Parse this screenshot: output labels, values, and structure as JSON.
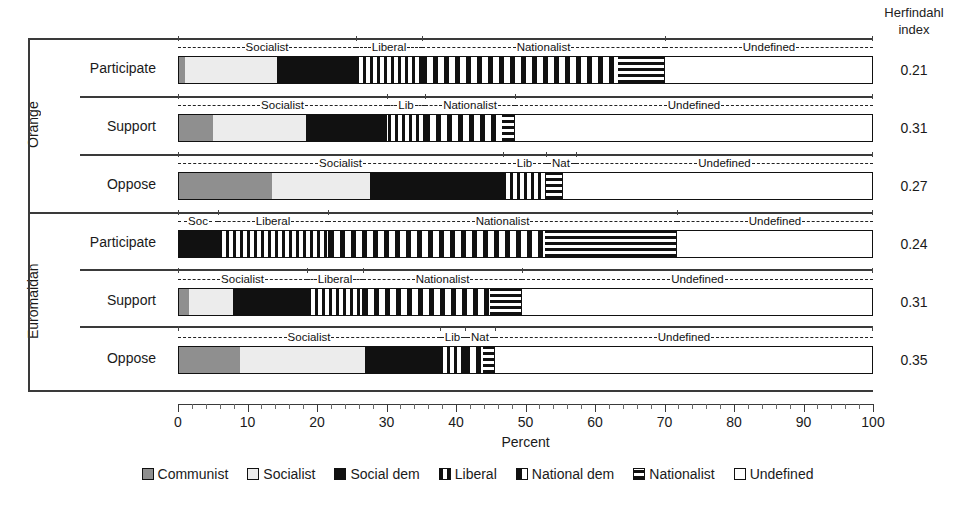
{
  "herfindahl_header": {
    "line1": "Herfindahl",
    "line2": "index"
  },
  "axis": {
    "title": "Percent",
    "ticks": [
      "0",
      "10",
      "20",
      "30",
      "40",
      "50",
      "60",
      "70",
      "80",
      "90",
      "100"
    ]
  },
  "groups": [
    {
      "name": "Orange"
    },
    {
      "name": "Euromaidan"
    }
  ],
  "rows": [
    {
      "group": "Orange",
      "category": "Participate",
      "herfindahl": "0.21"
    },
    {
      "group": "Orange",
      "category": "Support",
      "herfindahl": "0.31"
    },
    {
      "group": "Orange",
      "category": "Oppose",
      "herfindahl": "0.27"
    },
    {
      "group": "Euromaidan",
      "category": "Participate",
      "herfindahl": "0.24"
    },
    {
      "group": "Euromaidan",
      "category": "Support",
      "herfindahl": "0.31"
    },
    {
      "group": "Euromaidan",
      "category": "Oppose",
      "herfindahl": "0.35"
    }
  ],
  "legend": [
    {
      "label": "Communist",
      "pattern": "communist"
    },
    {
      "label": "Socialist",
      "pattern": "socialist"
    },
    {
      "label": "Social dem",
      "pattern": "socialdem"
    },
    {
      "label": "Liberal",
      "pattern": "liberal"
    },
    {
      "label": "National dem",
      "pattern": "nationaldem"
    },
    {
      "label": "Nationalist",
      "pattern": "nationalist"
    },
    {
      "label": "Undefined",
      "pattern": "undefined"
    }
  ],
  "annotations": [
    [
      {
        "text": "Socialist",
        "from": 0,
        "to": 25.6
      },
      {
        "text": "Liberal",
        "from": 25.6,
        "to": 35.1
      },
      {
        "text": "Nationalist",
        "from": 35.1,
        "to": 70.1
      },
      {
        "text": "Undefined",
        "from": 70.1,
        "to": 100
      }
    ],
    [
      {
        "text": "Socialist",
        "from": 0,
        "to": 30.1
      },
      {
        "text": "Lib",
        "from": 30.1,
        "to": 35.5
      },
      {
        "text": "Nationalist",
        "from": 35.5,
        "to": 48.5
      },
      {
        "text": "Undefined",
        "from": 48.5,
        "to": 100
      }
    ],
    [
      {
        "text": "Socialist",
        "from": 0,
        "to": 46.8
      },
      {
        "text": "Lib",
        "from": 46.8,
        "to": 52.9
      },
      {
        "text": "Nat",
        "from": 52.9,
        "to": 55.4
      },
      {
        "text": "Undefined",
        "from": 55.4,
        "to": 100
      }
    ],
    [
      {
        "text": "Soc",
        "from": 0,
        "to": 5.8
      },
      {
        "text": "Liberal",
        "from": 5.8,
        "to": 21.6
      },
      {
        "text": "Nationalist",
        "from": 21.6,
        "to": 71.8
      },
      {
        "text": "Undefined",
        "from": 71.8,
        "to": 100
      }
    ],
    [
      {
        "text": "Socialist",
        "from": 0,
        "to": 18.6
      },
      {
        "text": "Liberal",
        "from": 18.6,
        "to": 26.6
      },
      {
        "text": "Nationalist",
        "from": 26.6,
        "to": 49.5
      },
      {
        "text": "Undefined",
        "from": 49.5,
        "to": 100
      }
    ],
    [
      {
        "text": "Socialist",
        "from": 0,
        "to": 37.7
      },
      {
        "text": "Lib",
        "from": 37.7,
        "to": 41.3
      },
      {
        "text": "Nat",
        "from": 41.3,
        "to": 45.6
      },
      {
        "text": "Undefined",
        "from": 45.6,
        "to": 100
      }
    ]
  ],
  "chart_data": {
    "type": "bar",
    "orientation": "horizontal",
    "stacked": true,
    "title": "",
    "xlabel": "Percent",
    "ylabel": "",
    "xlim": [
      0,
      100
    ],
    "grid": false,
    "legend_position": "bottom",
    "categories": [
      "Orange / Participate",
      "Orange / Support",
      "Orange / Oppose",
      "Euromaidan / Participate",
      "Euromaidan / Support",
      "Euromaidan / Oppose"
    ],
    "series": [
      {
        "name": "Communist",
        "values": [
          0.9,
          4.9,
          13.4,
          0.0,
          1.4,
          8.8
        ]
      },
      {
        "name": "Socialist",
        "values": [
          13.3,
          13.4,
          14.1,
          0.0,
          6.4,
          18.1
        ]
      },
      {
        "name": "Social dem",
        "values": [
          11.4,
          11.7,
          19.3,
          5.8,
          10.8,
          10.8
        ]
      },
      {
        "name": "Liberal",
        "values": [
          9.5,
          5.4,
          6.1,
          15.8,
          8.0,
          3.6
        ]
      },
      {
        "name": "National dem",
        "values": [
          28.2,
          11.1,
          0.0,
          31.2,
          18.3,
          2.6
        ]
      },
      {
        "name": "Nationalist",
        "values": [
          6.8,
          1.9,
          2.5,
          18.7,
          4.6,
          1.7
        ]
      },
      {
        "name": "Undefined",
        "values": [
          29.9,
          51.6,
          44.6,
          28.5,
          50.5,
          54.4
        ]
      }
    ],
    "annotation_rows": [
      [
        "Socialist",
        "Liberal",
        "Nationalist",
        "Undefined"
      ],
      [
        "Socialist",
        "Lib",
        "Nationalist",
        "Undefined"
      ],
      [
        "Socialist",
        "Lib",
        "Nat",
        "Undefined"
      ],
      [
        "Soc",
        "Liberal",
        "Nationalist",
        "Undefined"
      ],
      [
        "Socialist",
        "Liberal",
        "Nationalist",
        "Undefined"
      ],
      [
        "Socialist",
        "Lib",
        "Nat",
        "Undefined"
      ]
    ],
    "herfindahl_index": {
      "label": "Herfindahl index",
      "values": [
        0.21,
        0.31,
        0.27,
        0.24,
        0.31,
        0.35
      ]
    }
  }
}
